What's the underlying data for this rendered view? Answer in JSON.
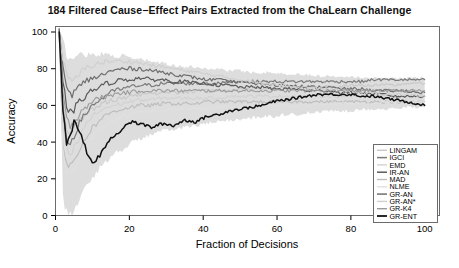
{
  "chart_data": {
    "type": "line",
    "title": "184 Filtered Cause−Effect Pairs Extracted from the ChaLearn Challenge",
    "xlabel": "Fraction of Decisions",
    "ylabel": "Accuracy",
    "xlim": [
      0,
      104
    ],
    "ylim": [
      0,
      103
    ],
    "xticks": [
      0,
      20,
      40,
      60,
      80,
      100
    ],
    "yticks": [
      0,
      20,
      40,
      60,
      80,
      100
    ],
    "xtick_labels": [
      "0",
      "20",
      "40",
      "60",
      "80",
      "100"
    ],
    "ytick_labels": [
      "0",
      "20",
      "40",
      "60",
      "80",
      "100"
    ],
    "grid": false,
    "legend_position": "bottom-right",
    "x": [
      1,
      2,
      3,
      4,
      5,
      6,
      7,
      8,
      9,
      10,
      12,
      14,
      16,
      18,
      20,
      23,
      26,
      29,
      32,
      35,
      38,
      41,
      44,
      47,
      50,
      53,
      56,
      59,
      62,
      65,
      68,
      71,
      74,
      77,
      80,
      83,
      86,
      89,
      92,
      95,
      98,
      100
    ],
    "series": [
      {
        "name": "LINGAM",
        "color": "#c8c8c8",
        "width": 1.1,
        "values": [
          100,
          62,
          48,
          44,
          47,
          50,
          52,
          55,
          57,
          58,
          60,
          62,
          63,
          64,
          65,
          66,
          66,
          67,
          67,
          67,
          68,
          68,
          68,
          68,
          69,
          69,
          69,
          69,
          70,
          70,
          70,
          70,
          70,
          70,
          71,
          71,
          71,
          71,
          71,
          72,
          72,
          72
        ]
      },
      {
        "name": "IGCI",
        "color": "#7a7a7a",
        "width": 1.2,
        "values": [
          100,
          55,
          41,
          40,
          44,
          48,
          52,
          55,
          58,
          60,
          63,
          66,
          68,
          69,
          70,
          71,
          71,
          72,
          72,
          72,
          72,
          72,
          72,
          73,
          73,
          73,
          73,
          73,
          73,
          73,
          73,
          73,
          73,
          73,
          73,
          73,
          74,
          74,
          74,
          74,
          74,
          74
        ]
      },
      {
        "name": "EMD",
        "color": "#d2d2d2",
        "width": 1.1,
        "values": [
          100,
          48,
          36,
          33,
          36,
          40,
          45,
          49,
          52,
          54,
          57,
          59,
          60,
          61,
          62,
          63,
          63,
          64,
          64,
          64,
          64,
          64,
          64,
          65,
          65,
          65,
          65,
          65,
          65,
          65,
          65,
          65,
          65,
          65,
          65,
          65,
          65,
          65,
          65,
          65,
          65,
          65
        ]
      },
      {
        "name": "IR-AN",
        "color": "#5a5a5a",
        "width": 1.2,
        "values": [
          100,
          72,
          60,
          56,
          58,
          60,
          63,
          65,
          67,
          68,
          70,
          72,
          73,
          74,
          74,
          75,
          74,
          74,
          73,
          73,
          72,
          72,
          71,
          71,
          70,
          70,
          70,
          69,
          69,
          69,
          68,
          68,
          68,
          67,
          67,
          67,
          66,
          66,
          65,
          65,
          65,
          65
        ]
      },
      {
        "name": "MAD",
        "color": "#bcbcbc",
        "width": 1.1,
        "values": [
          100,
          40,
          28,
          26,
          30,
          34,
          38,
          42,
          45,
          48,
          52,
          55,
          57,
          58,
          59,
          60,
          60,
          61,
          61,
          61,
          61,
          62,
          62,
          62,
          62,
          62,
          62,
          62,
          62,
          62,
          62,
          62,
          62,
          62,
          62,
          62,
          62,
          62,
          62,
          62,
          62,
          62
        ]
      },
      {
        "name": "NLME",
        "color": "#e0e0e0",
        "width": 1.1,
        "values": [
          100,
          35,
          24,
          22,
          25,
          29,
          33,
          37,
          40,
          43,
          47,
          50,
          52,
          54,
          55,
          56,
          57,
          57,
          58,
          58,
          58,
          58,
          59,
          59,
          59,
          59,
          60,
          60,
          60,
          60,
          60,
          61,
          61,
          61,
          61,
          61,
          61,
          62,
          62,
          62,
          62,
          62
        ]
      },
      {
        "name": "GR-AN",
        "color": "#6e6e6e",
        "width": 1.2,
        "values": [
          100,
          80,
          70,
          66,
          67,
          69,
          71,
          73,
          74,
          75,
          76,
          78,
          79,
          80,
          80,
          80,
          79,
          78,
          77,
          76,
          75,
          74,
          74,
          73,
          73,
          72,
          72,
          71,
          71,
          71,
          70,
          70,
          70,
          69,
          69,
          69,
          68,
          68,
          68,
          68,
          67,
          67
        ]
      },
      {
        "name": "GR-AN*",
        "color": "#cfcfcf",
        "width": 1.1,
        "values": [
          100,
          85,
          76,
          73,
          74,
          76,
          78,
          80,
          81,
          82,
          83,
          84,
          84,
          84,
          84,
          83,
          82,
          81,
          80,
          79,
          78,
          77,
          76,
          75,
          74,
          73,
          72,
          72,
          71,
          70,
          70,
          69,
          69,
          68,
          68,
          67,
          67,
          66,
          66,
          66,
          65,
          65
        ]
      },
      {
        "name": "GR-K4",
        "color": "#9a9a9a",
        "width": 1.1,
        "values": [
          100,
          66,
          52,
          49,
          51,
          54,
          57,
          59,
          61,
          62,
          64,
          65,
          66,
          67,
          67,
          68,
          68,
          68,
          68,
          68,
          68,
          68,
          68,
          68,
          68,
          68,
          68,
          68,
          68,
          68,
          68,
          68,
          68,
          68,
          68,
          68,
          68,
          68,
          68,
          68,
          68,
          68
        ]
      },
      {
        "name": "GR-ENT",
        "color": "#111111",
        "width": 1.5,
        "values": [
          100,
          58,
          40,
          42,
          52,
          47,
          44,
          38,
          31,
          29,
          32,
          40,
          44,
          47,
          51,
          50,
          48,
          50,
          49,
          52,
          51,
          54,
          55,
          57,
          58,
          59,
          60,
          62,
          63,
          64,
          65,
          66,
          66,
          66,
          66,
          65,
          65,
          64,
          63,
          62,
          61,
          60
        ]
      }
    ],
    "confidence_band": {
      "color": "#dddddd",
      "upper": [
        100,
        95,
        88,
        85,
        86,
        87,
        88,
        88,
        88,
        88,
        88,
        88,
        87,
        87,
        86,
        85,
        84,
        83,
        82,
        81,
        81,
        80,
        80,
        79,
        79,
        78,
        78,
        78,
        77,
        77,
        77,
        76,
        76,
        76,
        76,
        75,
        75,
        75,
        75,
        75,
        75,
        75
      ],
      "lower": [
        100,
        10,
        2,
        1,
        3,
        6,
        10,
        14,
        18,
        21,
        26,
        30,
        34,
        36,
        39,
        42,
        44,
        46,
        47,
        48,
        49,
        50,
        51,
        52,
        52,
        53,
        54,
        54,
        55,
        55,
        56,
        56,
        57,
        57,
        57,
        58,
        58,
        58,
        58,
        59,
        59,
        59
      ]
    }
  }
}
